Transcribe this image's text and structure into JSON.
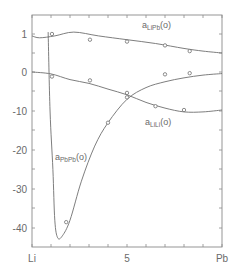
{
  "chart_data": {
    "type": "line",
    "title": "",
    "xlabel": "",
    "ylabel": "",
    "x_tick_labels": [
      {
        "x": 0,
        "label": "Li"
      },
      {
        "x": 5,
        "label": "5"
      },
      {
        "x": 10,
        "label": "Pb"
      }
    ],
    "xlim": [
      0,
      10
    ],
    "y_tick_labels": [
      "1",
      "0",
      "-10",
      "-20",
      "-30",
      "-40"
    ],
    "grid": false,
    "series": [
      {
        "name": "a_LiPb(o)",
        "label_main": "a",
        "label_sub": "LiPb",
        "label_suffix": "(o)",
        "curve": [
          [
            0,
            0.95
          ],
          [
            0.4,
            0.9
          ],
          [
            1.2,
            0.95
          ],
          [
            2.2,
            1.05
          ],
          [
            3.5,
            0.95
          ],
          [
            5.0,
            0.85
          ],
          [
            6.5,
            0.75
          ],
          [
            8.0,
            0.62
          ],
          [
            9.0,
            0.55
          ],
          [
            10,
            0.5
          ]
        ],
        "points": [
          [
            1.05,
            1.0
          ],
          [
            3.05,
            0.85
          ],
          [
            5.0,
            0.8
          ],
          [
            7.0,
            0.7
          ],
          [
            8.3,
            0.55
          ]
        ]
      },
      {
        "name": "a_LiLi(o)",
        "label_main": "a",
        "label_sub": "LiLi",
        "label_suffix": "(o)",
        "curve": [
          [
            0,
            0.0
          ],
          [
            1.0,
            -0.05
          ],
          [
            2.0,
            -0.2
          ],
          [
            3.0,
            -0.3
          ],
          [
            4.0,
            -0.45
          ],
          [
            5.0,
            -0.6
          ],
          [
            6.0,
            -0.8
          ],
          [
            7.0,
            -0.95
          ],
          [
            8.0,
            -1.05
          ],
          [
            9.0,
            -1.05
          ],
          [
            10,
            -1.0
          ]
        ],
        "points": [
          [
            1.05,
            -0.12
          ],
          [
            3.05,
            -0.22
          ],
          [
            5.0,
            -0.55
          ],
          [
            6.5,
            -0.9
          ],
          [
            8.0,
            -1.0
          ]
        ]
      },
      {
        "name": "a_PbPb(o)",
        "label_main": "a",
        "label_sub": "PbPb",
        "label_suffix": "(o)",
        "curve": [
          [
            0.85,
            1.05
          ],
          [
            0.95,
            -10
          ],
          [
            1.1,
            -25
          ],
          [
            1.2,
            -38
          ],
          [
            1.35,
            -42.5
          ],
          [
            1.6,
            -42
          ],
          [
            2.0,
            -38
          ],
          [
            2.6,
            -28
          ],
          [
            3.3,
            -19
          ],
          [
            4.0,
            -13
          ],
          [
            5.0,
            -7
          ],
          [
            6.0,
            -4
          ],
          [
            7.0,
            -2.5
          ],
          [
            8.0,
            -1.5
          ],
          [
            9.0,
            -0.8
          ],
          [
            10,
            -0.4
          ]
        ],
        "points": [
          [
            1.8,
            -38.5
          ],
          [
            4.0,
            -13
          ],
          [
            5.0,
            -6.5
          ],
          [
            7.0,
            -0.6
          ],
          [
            8.3,
            -0.3
          ]
        ]
      }
    ]
  }
}
